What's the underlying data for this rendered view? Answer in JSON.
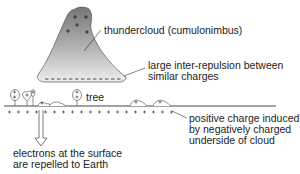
{
  "diagram": {
    "top_fragment": "",
    "labels": {
      "cloud": "thundercloud (cumulonimbus)",
      "repulsion_line1": "large inter-repulsion between",
      "repulsion_line2": "similar charges",
      "tree": "tree",
      "induced_line1": "positive charge induced",
      "induced_line2": "by negatively charged",
      "induced_line3": "underside of cloud",
      "electrons_line1": "electrons at the surface",
      "electrons_line2": "are repelled to Earth"
    },
    "charges": {
      "cloud_top": "+",
      "cloud_bottom": "-",
      "ground": "+"
    },
    "colors": {
      "cloud_top": "#7a7a7a",
      "cloud_bottom": "#ececec",
      "line": "#333333"
    }
  }
}
